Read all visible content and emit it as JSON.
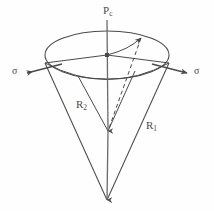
{
  "figure": {
    "background_color": "#fefefe",
    "stroke_color": "#4a4a4a",
    "labels": {
      "axis_label_base": "P",
      "axis_label_sub": "c",
      "sigma_left": "σ",
      "sigma_right": "σ",
      "radius_inner_base": "R",
      "radius_inner_sub": "2",
      "radius_outer_base": "R",
      "radius_outer_sub": "1"
    },
    "geometry": {
      "ellipse_center_x": 107,
      "ellipse_center_y": 55,
      "ellipse_radius_x": 62,
      "ellipse_radius_y": 24,
      "apex_outer_x": 107,
      "apex_outer_y": 200,
      "apex_inner_x": 108,
      "apex_inner_y": 132,
      "axis_top_y": 20,
      "dashed_start_x": 141,
      "dashed_start_y": 38
    }
  }
}
